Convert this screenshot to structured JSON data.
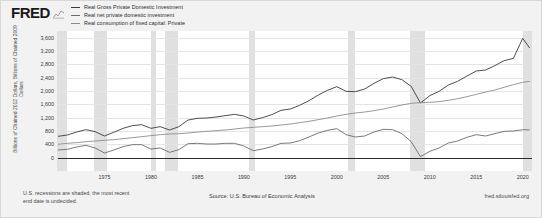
{
  "brand": {
    "logo_text": "FRED",
    "mark_name": "fred-chart-mark"
  },
  "legend": {
    "items": [
      {
        "label": "Real Gross Private Domestic Investment",
        "color": "#3b3b3b"
      },
      {
        "label": "Real net private domestic investment",
        "color": "#6b6b6b"
      },
      {
        "label": "Real consumption of fixed capital: Private",
        "color": "#8c8c8c"
      }
    ]
  },
  "axis": {
    "ylabel_line1": "Billions of Chained 2012 Dollars, Billions of Chained 2009",
    "ylabel_line2": "Dollars"
  },
  "footer": {
    "recession_note_line1": "U.S. recessions are shaded, the most recent",
    "recession_note_line2": "end date is undecided.",
    "source": "Source: U.S. Bureau of Economic Analysis",
    "url": "fred.stlouisfed.org"
  },
  "chart_data": {
    "type": "line",
    "title": "",
    "xlabel": "",
    "ylabel": "Billions of Chained 2012 Dollars, Billions of Chained 2009 Dollars",
    "xlim": [
      1970,
      2021
    ],
    "ylim": [
      -400,
      3800
    ],
    "grid": true,
    "legend_position": "top",
    "ytick_labels": [
      "3,600",
      "3,200",
      "2,800",
      "2,400",
      "2,000",
      "1,600",
      "1,200",
      "800",
      "400",
      "0"
    ],
    "ytick_values": [
      3600,
      3200,
      2800,
      2400,
      2000,
      1600,
      1200,
      800,
      400,
      0
    ],
    "xtick_labels": [
      "1975",
      "1980",
      "1985",
      "1990",
      "1995",
      "2000",
      "2005",
      "2010",
      "2015",
      "2020"
    ],
    "xtick_values": [
      1975,
      1980,
      1985,
      1990,
      1995,
      2000,
      2005,
      2010,
      2015,
      2020
    ],
    "recession_bands": [
      {
        "start": 1969.92,
        "end": 1970.92
      },
      {
        "start": 1973.92,
        "end": 1975.25
      },
      {
        "start": 1980.0,
        "end": 1980.5
      },
      {
        "start": 1981.5,
        "end": 1982.92
      },
      {
        "start": 1990.5,
        "end": 1991.25
      },
      {
        "start": 2001.25,
        "end": 2001.92
      },
      {
        "start": 2007.92,
        "end": 2009.5
      },
      {
        "start": 2020.08,
        "end": 2021.0
      }
    ],
    "x": [
      1970,
      1971,
      1972,
      1973,
      1974,
      1975,
      1976,
      1977,
      1978,
      1979,
      1980,
      1981,
      1982,
      1983,
      1984,
      1985,
      1986,
      1987,
      1988,
      1989,
      1990,
      1991,
      1992,
      1993,
      1994,
      1995,
      1996,
      1997,
      1998,
      1999,
      2000,
      2001,
      2002,
      2003,
      2004,
      2005,
      2006,
      2007,
      2008,
      2009,
      2010,
      2011,
      2012,
      2013,
      2014,
      2015,
      2016,
      2017,
      2018,
      2019,
      2020,
      2020.75
    ],
    "series": [
      {
        "name": "Real Gross Private Domestic Investment",
        "color": "#3b3b3b",
        "values": [
          640,
          680,
          770,
          840,
          780,
          650,
          760,
          880,
          960,
          990,
          880,
          930,
          830,
          930,
          1130,
          1180,
          1190,
          1220,
          1260,
          1300,
          1250,
          1130,
          1200,
          1290,
          1420,
          1460,
          1570,
          1710,
          1880,
          2020,
          2130,
          1990,
          1980,
          2060,
          2230,
          2370,
          2420,
          2340,
          2140,
          1640,
          1860,
          1990,
          2180,
          2290,
          2450,
          2600,
          2630,
          2760,
          2910,
          2980,
          3580,
          3290
        ]
      },
      {
        "name": "Real net private domestic investment",
        "color": "#6b6b6b",
        "values": [
          230,
          250,
          320,
          370,
          290,
          140,
          230,
          330,
          390,
          390,
          260,
          290,
          160,
          240,
          420,
          430,
          410,
          410,
          430,
          430,
          350,
          210,
          260,
          330,
          430,
          440,
          510,
          620,
          740,
          820,
          870,
          690,
          620,
          650,
          770,
          850,
          840,
          720,
          480,
          30,
          190,
          290,
          440,
          500,
          610,
          690,
          650,
          720,
          790,
          800,
          840,
          830
        ]
      },
      {
        "name": "Real consumption of fixed capital: Private",
        "color": "#8c8c8c",
        "values": [
          400,
          430,
          450,
          480,
          500,
          520,
          540,
          570,
          600,
          630,
          660,
          690,
          710,
          720,
          740,
          770,
          790,
          810,
          830,
          860,
          890,
          910,
          930,
          950,
          980,
          1010,
          1050,
          1090,
          1140,
          1190,
          1250,
          1300,
          1340,
          1370,
          1410,
          1460,
          1520,
          1580,
          1630,
          1650,
          1660,
          1680,
          1720,
          1770,
          1830,
          1900,
          1970,
          2030,
          2110,
          2190,
          2260,
          2290
        ]
      }
    ]
  }
}
